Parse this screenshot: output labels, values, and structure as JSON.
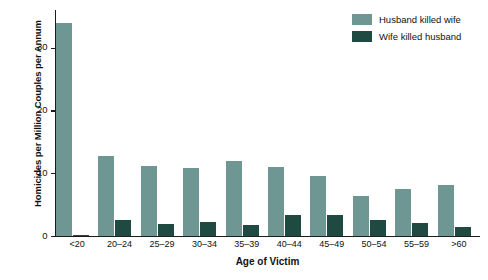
{
  "chart_data": {
    "type": "bar",
    "title": "",
    "xlabel": "Age of Victim",
    "ylabel": "Homicides per Million Couples per Annum",
    "categories": [
      "<20",
      "20–24",
      "25–29",
      "30–34",
      "35–39",
      "40–44",
      "45–49",
      "50–54",
      "55–59",
      ">60"
    ],
    "series": [
      {
        "name": "Husband killed wife",
        "color": "#6e9693",
        "values": [
          34.0,
          12.7,
          11.2,
          10.8,
          12.0,
          11.0,
          9.5,
          6.3,
          7.5,
          8.1
        ]
      },
      {
        "name": "Wife killed husband",
        "color": "#1e4a42",
        "values": [
          0.2,
          2.5,
          1.9,
          2.2,
          1.8,
          3.4,
          3.3,
          2.6,
          2.0,
          1.4
        ]
      }
    ],
    "ylim": [
      0,
      36
    ],
    "yticks": [
      0,
      10,
      20,
      30
    ],
    "ytick_labels": [
      "0",
      "10",
      "20",
      "30"
    ],
    "grid": false,
    "legend_position": "top-right"
  },
  "legend": {
    "items": [
      {
        "label": "Husband killed wife"
      },
      {
        "label": "Wife killed husband"
      }
    ]
  }
}
